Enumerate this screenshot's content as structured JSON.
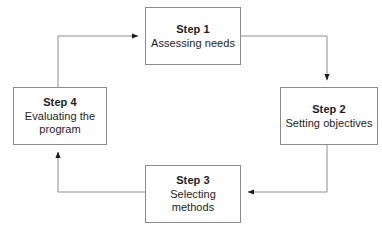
{
  "diagram": {
    "background_color": "#ffffff",
    "line_color": "#8c8c8c",
    "arrow_color": "#1c1c1c",
    "text_color": "#1c1c1c",
    "steps": [
      {
        "id": "step-1",
        "title": "Step 1",
        "desc": "Assessing needs"
      },
      {
        "id": "step-2",
        "title": "Step 2",
        "desc": "Setting objectives"
      },
      {
        "id": "step-3",
        "title": "Step 3",
        "desc": "Selecting methods"
      },
      {
        "id": "step-4",
        "title": "Step 4",
        "desc": "Evaluating the program"
      }
    ],
    "connectors": [
      {
        "id": "connector-1-to-2",
        "from": "step-1",
        "to": "step-2"
      },
      {
        "id": "connector-2-to-3",
        "from": "step-2",
        "to": "step-3"
      },
      {
        "id": "connector-3-to-4",
        "from": "step-3",
        "to": "step-4"
      },
      {
        "id": "connector-4-to-1",
        "from": "step-4",
        "to": "step-1"
      }
    ]
  }
}
